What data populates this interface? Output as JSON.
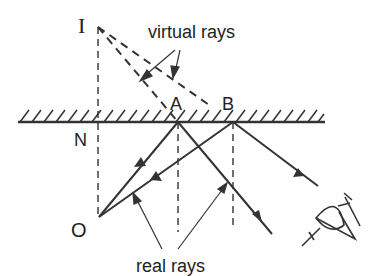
{
  "labels": {
    "image_point": "I",
    "normal_point": "N",
    "object_point": "O",
    "reflection_point_a": "A",
    "reflection_point_b": "B",
    "virtual_rays": "virtual rays",
    "real_rays": "real rays"
  },
  "points": {
    "I": [
      98,
      27
    ],
    "N": [
      98,
      122
    ],
    "O": [
      99,
      217
    ],
    "A": [
      178,
      122
    ],
    "B": [
      233,
      122
    ]
  },
  "colors": {
    "line": "#333333",
    "background": "#ffffff"
  }
}
